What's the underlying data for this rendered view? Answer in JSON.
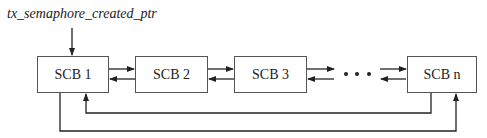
{
  "diagram": {
    "pointer_label": "tx_semaphore_created_ptr",
    "nodes": [
      {
        "id": "scb1",
        "label": "SCB 1"
      },
      {
        "id": "scb2",
        "label": "SCB 2"
      },
      {
        "id": "scb3",
        "label": "SCB 3"
      },
      {
        "id": "scbn",
        "label": "SCB n"
      }
    ],
    "ellipsis": "• • •",
    "edges": [
      {
        "from": "pointer_label",
        "to": "scb1"
      },
      {
        "from": "scb1",
        "to": "scb2"
      },
      {
        "from": "scb2",
        "to": "scb1"
      },
      {
        "from": "scb2",
        "to": "scb3"
      },
      {
        "from": "scb3",
        "to": "scb2"
      },
      {
        "from": "scb3",
        "to": "ellipsis"
      },
      {
        "from": "ellipsis",
        "to": "scb3"
      },
      {
        "from": "ellipsis",
        "to": "scbn"
      },
      {
        "from": "scbn",
        "to": "ellipsis"
      },
      {
        "from": "scbn",
        "to": "scb1"
      },
      {
        "from": "scb1",
        "to": "scbn"
      }
    ],
    "line_color": "#222222",
    "box_border_color": "#555555"
  }
}
